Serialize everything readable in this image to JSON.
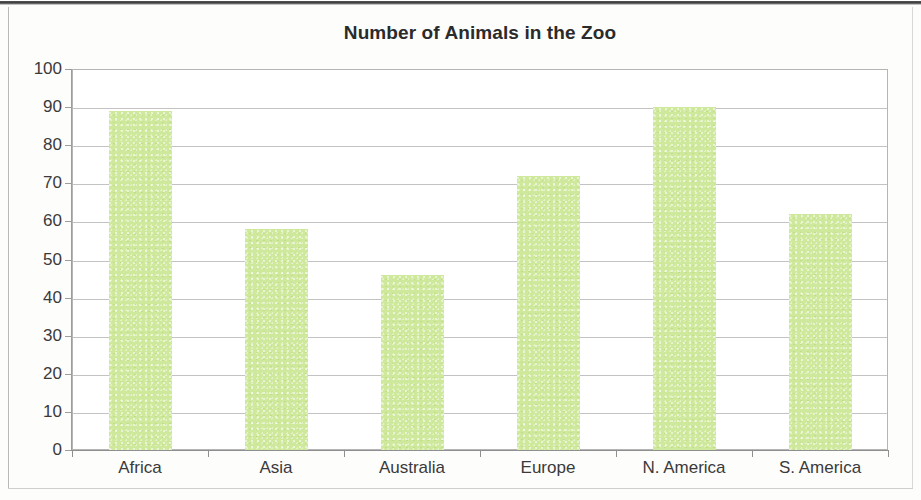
{
  "chart_data": {
    "type": "bar",
    "title": "Number of Animals in the Zoo",
    "xlabel": "",
    "ylabel": "",
    "categories": [
      "Africa",
      "Asia",
      "Australia",
      "Europe",
      "N. America",
      "S. America"
    ],
    "values": [
      89,
      58,
      46,
      72,
      90,
      62
    ],
    "ylim": [
      0,
      100
    ],
    "ytick_labels": [
      "100",
      "90",
      "80",
      "70",
      "60",
      "50",
      "40",
      "30",
      "20",
      "10",
      "0"
    ],
    "ytick_values": [
      100,
      90,
      80,
      70,
      60,
      50,
      40,
      30,
      20,
      10,
      0
    ],
    "ytick_step": 10,
    "grid": true,
    "grid_axis": "y",
    "legend": false,
    "legend_position": "none",
    "bar_color": "#cfe99c",
    "plot_border_color": "#b5b5b5",
    "axis_color": "#9d9d9d",
    "gridline_color": "#c3c3c3",
    "title_color": "#2b2b2b",
    "tick_label_color": "#3a3a3a"
  }
}
